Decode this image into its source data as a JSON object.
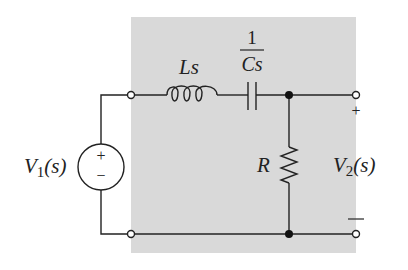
{
  "diagram": {
    "type": "circuit",
    "title": "",
    "colors": {
      "shaded_region": "#d9d9d9",
      "wire": "#222222",
      "background": "#ffffff"
    },
    "components": {
      "source": {
        "label_main": "V",
        "label_sub": "1",
        "label_arg": "(s)",
        "plus": "+",
        "minus": "−"
      },
      "inductor": {
        "label": "Ls"
      },
      "capacitor": {
        "numerator": "1",
        "denominator": "Cs"
      },
      "resistor": {
        "label": "R"
      },
      "output": {
        "label_main": "V",
        "label_sub": "2",
        "label_arg": "(s)",
        "plus": "+",
        "minus": "—"
      }
    }
  }
}
